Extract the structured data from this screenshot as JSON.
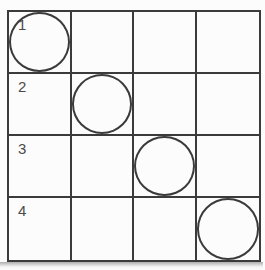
{
  "matrix": {
    "columns": 4,
    "rows": [
      {
        "label": "1",
        "circle_col": 1
      },
      {
        "label": "2",
        "circle_col": 2
      },
      {
        "label": "3",
        "circle_col": 3
      },
      {
        "label": "4",
        "circle_col": 4
      }
    ]
  },
  "colors": {
    "line": "#3b3b3b",
    "background": "#fcfcfc",
    "label_text": "#4a4a4a",
    "bottom_shadow": "#6e6e6e"
  }
}
